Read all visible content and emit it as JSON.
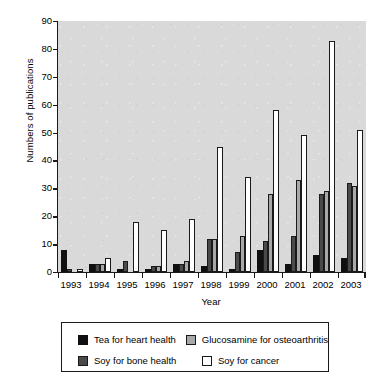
{
  "chart_data": {
    "type": "bar",
    "title": "",
    "xlabel": "Year",
    "ylabel": "Numbers of publications",
    "ylim": [
      0,
      90
    ],
    "ytick_step": 10,
    "yticks": [
      0,
      10,
      20,
      30,
      40,
      50,
      60,
      70,
      80,
      90
    ],
    "grid": false,
    "legend_position": "below-plot",
    "plot_background": "#d9d9d9",
    "categories": [
      "1993",
      "1994",
      "1995",
      "1996",
      "1997",
      "1998",
      "1999",
      "2000",
      "2001",
      "2002",
      "2003"
    ],
    "series": [
      {
        "name": "Tea for heart health",
        "color": "#101010",
        "values": [
          8,
          3,
          1,
          1,
          3,
          2,
          1,
          8,
          3,
          6,
          5
        ]
      },
      {
        "name": "Soy for bone health",
        "color": "#4a4a4a",
        "values": [
          1,
          3,
          4,
          2,
          3,
          12,
          7,
          11,
          13,
          28,
          32
        ]
      },
      {
        "name": "Glucosamine for osteoarthritis",
        "color": "#a8a8a8",
        "values": [
          0,
          3,
          0,
          2,
          4,
          12,
          13,
          28,
          33,
          29,
          31
        ]
      },
      {
        "name": "Soy for cancer",
        "color": "#ffffff",
        "values": [
          1,
          5,
          18,
          15,
          19,
          45,
          34,
          58,
          49,
          83,
          51
        ]
      }
    ]
  },
  "legend": {
    "items": [
      {
        "label": "Tea for heart health",
        "swatch": "legend-swatch-black"
      },
      {
        "label": "Glucosamine for osteoarthritis",
        "swatch": "legend-swatch-light-gray"
      },
      {
        "label": "Soy for bone health",
        "swatch": "legend-swatch-dark-gray"
      },
      {
        "label": "Soy for cancer",
        "swatch": "legend-swatch-white"
      }
    ]
  }
}
